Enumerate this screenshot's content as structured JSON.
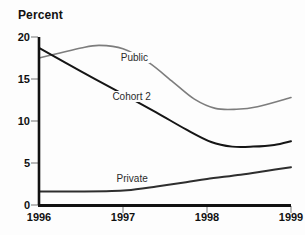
{
  "chart_data": {
    "type": "line",
    "title": "Percent",
    "xlabel": "",
    "ylabel": "Percent",
    "x": [
      "1996",
      "1997",
      "1998",
      "1999"
    ],
    "xlim": [
      1996,
      1999
    ],
    "ylim": [
      0,
      20
    ],
    "yticks": [
      "0",
      "5",
      "10",
      "15",
      "20"
    ],
    "ytick_values": [
      0,
      5,
      10,
      15,
      20
    ],
    "xticks": [
      "1996",
      "1997",
      "1998",
      "1999"
    ],
    "grid": false,
    "legend_position": "inline-labels",
    "series": [
      {
        "name": "Public",
        "color": "#7d7d7d",
        "values": [
          17.5,
          18.9,
          12.4,
          12.8
        ],
        "points": [
          [
            1996.0,
            17.5
          ],
          [
            1996.25,
            18.1
          ],
          [
            1996.5,
            18.7
          ],
          [
            1996.72,
            19.0
          ],
          [
            1997.0,
            18.6
          ],
          [
            1997.3,
            17.0
          ],
          [
            1997.6,
            14.6
          ],
          [
            1997.85,
            12.6
          ],
          [
            1998.1,
            11.5
          ],
          [
            1998.35,
            11.4
          ],
          [
            1998.6,
            11.7
          ],
          [
            1999.0,
            12.8
          ]
        ]
      },
      {
        "name": "Cohort 2",
        "color": "#151515",
        "values": [
          18.7,
          13.2,
          7.6,
          7.6
        ],
        "points": [
          [
            1996.0,
            18.7
          ],
          [
            1996.5,
            15.9
          ],
          [
            1997.0,
            13.2
          ],
          [
            1997.4,
            11.0
          ],
          [
            1997.75,
            9.0
          ],
          [
            1998.05,
            7.5
          ],
          [
            1998.3,
            6.95
          ],
          [
            1998.55,
            6.95
          ],
          [
            1998.8,
            7.15
          ],
          [
            1999.0,
            7.6
          ]
        ]
      },
      {
        "name": "Private",
        "color": "#2e2e2e",
        "values": [
          1.6,
          1.7,
          3.1,
          4.5
        ],
        "points": [
          [
            1996.0,
            1.6
          ],
          [
            1996.4,
            1.6
          ],
          [
            1996.8,
            1.65
          ],
          [
            1997.05,
            1.75
          ],
          [
            1997.4,
            2.2
          ],
          [
            1997.75,
            2.7
          ],
          [
            1998.0,
            3.1
          ],
          [
            1998.4,
            3.6
          ],
          [
            1998.7,
            4.05
          ],
          [
            1999.0,
            4.5
          ]
        ]
      }
    ],
    "annotations": [
      {
        "text": "Public",
        "x": 1996.95,
        "y": 17.4
      },
      {
        "text": "Cohort 2",
        "x": 1996.85,
        "y": 12.7
      },
      {
        "text": "Private",
        "x": 1996.9,
        "y": 3.0
      }
    ],
    "colors": {
      "axis": "#111111",
      "tick": "#9a9a9a",
      "text": "#111111",
      "background": "#fdfdfd"
    }
  }
}
